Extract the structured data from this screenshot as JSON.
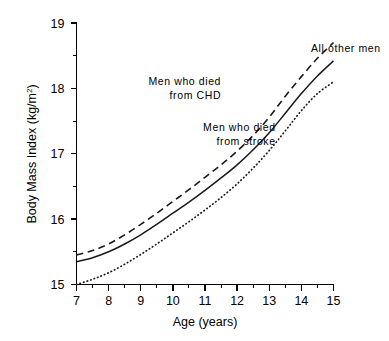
{
  "chart_data": {
    "type": "line",
    "title": "",
    "subtitle": "",
    "xlabel": "Age (years)",
    "ylabel": "Body Mass Index (kg/m",
    "ylabel_sup": "2",
    "ylabel_tail": ")",
    "ylabel_full": "Body Mass Index (kg/m²)",
    "xlim": [
      7,
      15
    ],
    "ylim": [
      15,
      19
    ],
    "grid": false,
    "legend_position": "inline-annotations",
    "x_ticks": [
      7,
      8,
      9,
      10,
      11,
      12,
      13,
      14,
      15
    ],
    "x_tick_labels": [
      "7",
      "8",
      "9",
      "10",
      "11",
      "12",
      "13",
      "14",
      "15"
    ],
    "x_minor_ticks": [
      7.5,
      8.5,
      9.5,
      10.5,
      11.5,
      12.5,
      13.5,
      14.5
    ],
    "y_ticks": [
      15,
      16,
      17,
      18,
      19
    ],
    "y_tick_labels": [
      "15",
      "16",
      "17",
      "18",
      "19"
    ],
    "y_minor_ticks": [
      15.5,
      16.5,
      17.5,
      18.5
    ],
    "x": [
      7,
      7.5,
      8,
      8.5,
      9,
      9.5,
      10,
      10.5,
      11,
      11.5,
      12,
      12.5,
      13,
      13.5,
      14,
      14.5,
      15
    ],
    "series": [
      {
        "name": "Men who died from CHD",
        "style": "dashed",
        "color": "#1a1a1a",
        "values": [
          15.45,
          15.52,
          15.62,
          15.76,
          15.92,
          16.09,
          16.27,
          16.45,
          16.64,
          16.83,
          17.04,
          17.28,
          17.56,
          17.88,
          18.18,
          18.46,
          18.7
        ]
      },
      {
        "name": "All other men",
        "style": "solid",
        "color": "#1a1a1a",
        "values": [
          15.35,
          15.41,
          15.5,
          15.62,
          15.76,
          15.92,
          16.09,
          16.26,
          16.44,
          16.63,
          16.83,
          17.06,
          17.32,
          17.62,
          17.92,
          18.19,
          18.42
        ]
      },
      {
        "name": "Men who died from stroke",
        "style": "dotted",
        "color": "#1a1a1a",
        "values": [
          15.0,
          15.08,
          15.18,
          15.31,
          15.46,
          15.62,
          15.79,
          15.96,
          16.14,
          16.33,
          16.54,
          16.78,
          17.05,
          17.35,
          17.66,
          17.92,
          18.1
        ]
      }
    ],
    "annotations": [
      {
        "text_line1": "All other men",
        "text_line2": "",
        "anchor_x": 14.3,
        "anchor_y": 18.55
      },
      {
        "text_line1": "Men who died",
        "text_line2": "from CHD",
        "anchor_x": 11.5,
        "anchor_y": 18.05
      },
      {
        "text_line1": "Men who died",
        "text_line2": "from stroke",
        "anchor_x": 13.2,
        "anchor_y": 17.35
      }
    ]
  }
}
